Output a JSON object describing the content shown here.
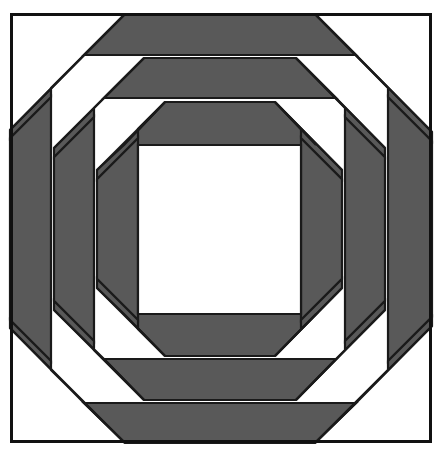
{
  "canvas": {
    "width": 438,
    "height": 450,
    "background": "#ffffff"
  },
  "artwork": {
    "title": "Pineapple Quilt Block",
    "type": "geometric-quilt-block",
    "symmetry": "4-fold mirror (horizontal and vertical axes)",
    "ring_count": 4,
    "description": "Concentric octagonal rings of alternating dark-gray and white trapezoidal strips radiating from a central white square."
  },
  "palette": {
    "dark": "#595959",
    "light": "#ffffff",
    "outline": "#1a1a1a",
    "frame": "#111111",
    "background": "#ffffff"
  },
  "frame": {
    "x": 10,
    "y": 13,
    "width": 422,
    "height": 430,
    "stroke_width": 3,
    "label": "outer-border"
  },
  "center_square": {
    "x1": 138,
    "y1": 145,
    "x2": 301,
    "y2": 314,
    "fill": "#ffffff",
    "label": "center-patch"
  },
  "geometry": {
    "cx": 219.5,
    "cy": 229.5,
    "band_edges_top": [
      13,
      14,
      55,
      58,
      98,
      102,
      145
    ],
    "band_edges_bottom": [
      314,
      356,
      359,
      400,
      403,
      443
    ],
    "band_edges_left": [
      10,
      51,
      54,
      94,
      97,
      138
    ],
    "band_edges_right": [
      301,
      342,
      345,
      385,
      388,
      432
    ],
    "corner_inset": 128
  },
  "rings": [
    {
      "index": 0,
      "name": "ring-outer",
      "fill": "#595959",
      "top": [
        14,
        55
      ],
      "bottom": [
        403,
        443
      ],
      "left": [
        10,
        51
      ],
      "right": [
        388,
        432
      ]
    },
    {
      "index": 1,
      "name": "ring-second",
      "fill": "#595959",
      "top": [
        58,
        98
      ],
      "bottom": [
        359,
        400
      ],
      "left": [
        54,
        94
      ],
      "right": [
        345,
        385
      ]
    },
    {
      "index": 2,
      "name": "ring-third",
      "fill": "#595959",
      "top": [
        102,
        145
      ],
      "bottom": [
        314,
        356
      ],
      "left": [
        97,
        138
      ],
      "right": [
        301,
        342
      ]
    }
  ],
  "legend": {
    "dark_label": "dark fabric",
    "light_label": "light fabric"
  }
}
